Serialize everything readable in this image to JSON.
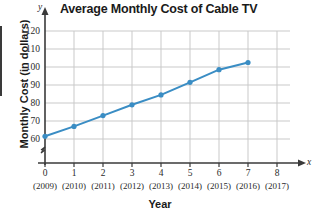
{
  "chart_data": {
    "type": "line",
    "title": "Average Monthly Cost of Cable TV",
    "xlabel": "Year",
    "ylabel": "Monthly Cost (in dollars)",
    "x": [
      0,
      1,
      2,
      3,
      4,
      5,
      6,
      7
    ],
    "values": [
      61.5,
      67.0,
      73.0,
      79.0,
      84.5,
      91.5,
      98.5,
      102.5
    ],
    "categories": [
      "(2009)",
      "(2010)",
      "(2011)",
      "(2012)",
      "(2013)",
      "(2014)",
      "(2015)",
      "(2016)"
    ],
    "xticks": [
      "0",
      "1",
      "2",
      "3",
      "4",
      "5",
      "6",
      "7",
      "8"
    ],
    "xtick_years": [
      "(2009)",
      "(2010)",
      "(2011)",
      "(2012)",
      "(2013)",
      "(2014)",
      "(2015)",
      "(2016)",
      "(2017)"
    ],
    "yticks": [
      "60",
      "70",
      "80",
      "90",
      "100",
      "110",
      "120"
    ],
    "xlim": [
      0,
      8
    ],
    "ylim": [
      60,
      120
    ],
    "grid": true,
    "legend": "none",
    "y_axis_break": true,
    "x_axis_name": "x",
    "y_axis_name": "y",
    "series_color": "#3a8dc4",
    "grid_color": "#c9c9c9",
    "axis_color": "#3a3a3a"
  }
}
